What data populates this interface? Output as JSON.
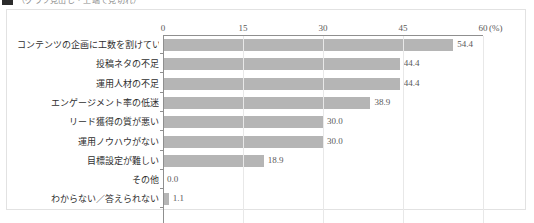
{
  "heading": {
    "marker_icon": "square-bullet-icon",
    "text": "（グラフ見出し・上端で見切れ）"
  },
  "chart_data": {
    "type": "bar",
    "orientation": "horizontal",
    "title": "",
    "xlabel": "",
    "ylabel": "",
    "unit_label": "(%)",
    "xlim": [
      0,
      60
    ],
    "xticks": [
      0,
      15,
      30,
      45,
      60
    ],
    "xtick_labels": [
      "0",
      "15",
      "30",
      "45",
      "60"
    ],
    "grid": true,
    "legend": "none",
    "bar_color": "#b5b5b5",
    "categories": [
      "コンテンツの企画に工数を割けていない",
      "投稿ネタの不足",
      "運用人材の不足",
      "エンゲージメント率の低迷",
      "リード獲得の質が悪い",
      "運用ノウハウがない",
      "目標設定が難しい",
      "その他",
      "わからない／答えられない"
    ],
    "values": [
      54.4,
      44.4,
      44.4,
      38.9,
      30.0,
      30.0,
      18.9,
      0.0,
      1.1
    ],
    "value_labels": [
      "54.4",
      "44.4",
      "44.4",
      "38.9",
      "30.0",
      "30.0",
      "18.9",
      "0.0",
      "1.1"
    ]
  }
}
